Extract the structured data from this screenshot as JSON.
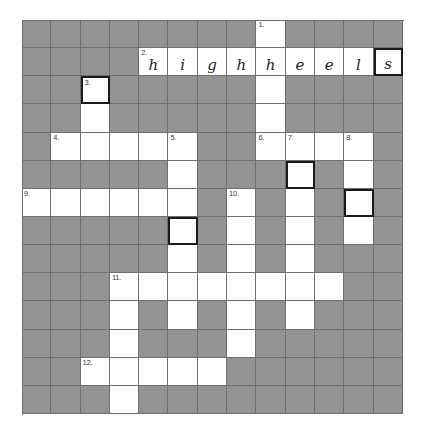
{
  "puzzle": {
    "title": "Crossword Puzzle",
    "columns": 13,
    "rows": 14,
    "colors": {
      "block": "#939393",
      "open": "#ffffff",
      "gridline": "#6f6f6f",
      "answer_border": "#1a1a1a",
      "number_text": "#3a3a3a",
      "letter_text": "#1d1d1d",
      "page_background": "#ffffff"
    },
    "clue_numbers": [
      "1.",
      "2.",
      "3.",
      "4.",
      "5.",
      "6.",
      "7.",
      "8.",
      "9.",
      "10.",
      "11.",
      "12."
    ],
    "filled_answer": {
      "number": "2.",
      "text": "highheels",
      "letters": [
        "h",
        "i",
        "g",
        "h",
        "h",
        "e",
        "e",
        "l",
        "s"
      ],
      "direction": "across",
      "start_row": 1,
      "start_col": 4
    },
    "cells": [
      [
        {
          "t": "block"
        },
        {
          "t": "block"
        },
        {
          "t": "block"
        },
        {
          "t": "block"
        },
        {
          "t": "block"
        },
        {
          "t": "block"
        },
        {
          "t": "block"
        },
        {
          "t": "block"
        },
        {
          "t": "open",
          "n": "1."
        },
        {
          "t": "block"
        },
        {
          "t": "block"
        },
        {
          "t": "block"
        },
        {
          "t": "block"
        }
      ],
      [
        {
          "t": "block"
        },
        {
          "t": "block"
        },
        {
          "t": "block"
        },
        {
          "t": "block"
        },
        {
          "t": "open",
          "n": "2.",
          "l": "h"
        },
        {
          "t": "open",
          "l": "i"
        },
        {
          "t": "open",
          "l": "g"
        },
        {
          "t": "open",
          "l": "h"
        },
        {
          "t": "open",
          "l": "h"
        },
        {
          "t": "open",
          "l": "e"
        },
        {
          "t": "open",
          "l": "e"
        },
        {
          "t": "open",
          "l": "l"
        },
        {
          "t": "answer",
          "l": "s"
        }
      ],
      [
        {
          "t": "block"
        },
        {
          "t": "block"
        },
        {
          "t": "answer",
          "n": "3."
        },
        {
          "t": "block"
        },
        {
          "t": "block"
        },
        {
          "t": "block"
        },
        {
          "t": "block"
        },
        {
          "t": "block"
        },
        {
          "t": "open"
        },
        {
          "t": "block"
        },
        {
          "t": "block"
        },
        {
          "t": "block"
        },
        {
          "t": "block"
        }
      ],
      [
        {
          "t": "block"
        },
        {
          "t": "block"
        },
        {
          "t": "open"
        },
        {
          "t": "block"
        },
        {
          "t": "block"
        },
        {
          "t": "block"
        },
        {
          "t": "block"
        },
        {
          "t": "block"
        },
        {
          "t": "open"
        },
        {
          "t": "block"
        },
        {
          "t": "block"
        },
        {
          "t": "block"
        },
        {
          "t": "block"
        }
      ],
      [
        {
          "t": "block"
        },
        {
          "t": "open",
          "n": "4."
        },
        {
          "t": "open"
        },
        {
          "t": "open"
        },
        {
          "t": "open"
        },
        {
          "t": "open",
          "n": "5."
        },
        {
          "t": "block"
        },
        {
          "t": "block"
        },
        {
          "t": "open",
          "n": "6."
        },
        {
          "t": "open",
          "n": "7."
        },
        {
          "t": "open"
        },
        {
          "t": "open",
          "n": "8."
        },
        {
          "t": "block"
        }
      ],
      [
        {
          "t": "block"
        },
        {
          "t": "block"
        },
        {
          "t": "block"
        },
        {
          "t": "block"
        },
        {
          "t": "block"
        },
        {
          "t": "open"
        },
        {
          "t": "block"
        },
        {
          "t": "block"
        },
        {
          "t": "block"
        },
        {
          "t": "answer"
        },
        {
          "t": "block"
        },
        {
          "t": "open"
        },
        {
          "t": "block"
        }
      ],
      [
        {
          "t": "open",
          "n": "9."
        },
        {
          "t": "open"
        },
        {
          "t": "open"
        },
        {
          "t": "open"
        },
        {
          "t": "open"
        },
        {
          "t": "open"
        },
        {
          "t": "block"
        },
        {
          "t": "open",
          "n": "10."
        },
        {
          "t": "block"
        },
        {
          "t": "open"
        },
        {
          "t": "block"
        },
        {
          "t": "answer"
        },
        {
          "t": "block"
        }
      ],
      [
        {
          "t": "block"
        },
        {
          "t": "block"
        },
        {
          "t": "block"
        },
        {
          "t": "block"
        },
        {
          "t": "block"
        },
        {
          "t": "answer"
        },
        {
          "t": "block"
        },
        {
          "t": "open"
        },
        {
          "t": "block"
        },
        {
          "t": "open"
        },
        {
          "t": "block"
        },
        {
          "t": "open"
        },
        {
          "t": "block"
        }
      ],
      [
        {
          "t": "block"
        },
        {
          "t": "block"
        },
        {
          "t": "block"
        },
        {
          "t": "block"
        },
        {
          "t": "block"
        },
        {
          "t": "open"
        },
        {
          "t": "block"
        },
        {
          "t": "open"
        },
        {
          "t": "block"
        },
        {
          "t": "open"
        },
        {
          "t": "block"
        },
        {
          "t": "block"
        },
        {
          "t": "block"
        }
      ],
      [
        {
          "t": "block"
        },
        {
          "t": "block"
        },
        {
          "t": "block"
        },
        {
          "t": "open",
          "n": "11."
        },
        {
          "t": "open"
        },
        {
          "t": "open"
        },
        {
          "t": "open"
        },
        {
          "t": "open"
        },
        {
          "t": "open"
        },
        {
          "t": "open"
        },
        {
          "t": "open"
        },
        {
          "t": "block"
        },
        {
          "t": "block"
        }
      ],
      [
        {
          "t": "block"
        },
        {
          "t": "block"
        },
        {
          "t": "block"
        },
        {
          "t": "open"
        },
        {
          "t": "block"
        },
        {
          "t": "open"
        },
        {
          "t": "block"
        },
        {
          "t": "open"
        },
        {
          "t": "block"
        },
        {
          "t": "open"
        },
        {
          "t": "block"
        },
        {
          "t": "block"
        },
        {
          "t": "block"
        }
      ],
      [
        {
          "t": "block"
        },
        {
          "t": "block"
        },
        {
          "t": "block"
        },
        {
          "t": "open"
        },
        {
          "t": "block"
        },
        {
          "t": "block"
        },
        {
          "t": "block"
        },
        {
          "t": "open"
        },
        {
          "t": "block"
        },
        {
          "t": "block"
        },
        {
          "t": "block"
        },
        {
          "t": "block"
        },
        {
          "t": "block"
        }
      ],
      [
        {
          "t": "block"
        },
        {
          "t": "block"
        },
        {
          "t": "open",
          "n": "12."
        },
        {
          "t": "open"
        },
        {
          "t": "open"
        },
        {
          "t": "open"
        },
        {
          "t": "open"
        },
        {
          "t": "block"
        },
        {
          "t": "block"
        },
        {
          "t": "block"
        },
        {
          "t": "block"
        },
        {
          "t": "block"
        },
        {
          "t": "block"
        }
      ],
      [
        {
          "t": "block"
        },
        {
          "t": "block"
        },
        {
          "t": "block"
        },
        {
          "t": "open"
        },
        {
          "t": "block"
        },
        {
          "t": "block"
        },
        {
          "t": "block"
        },
        {
          "t": "block"
        },
        {
          "t": "block"
        },
        {
          "t": "block"
        },
        {
          "t": "block"
        },
        {
          "t": "block"
        },
        {
          "t": "block"
        }
      ]
    ]
  }
}
